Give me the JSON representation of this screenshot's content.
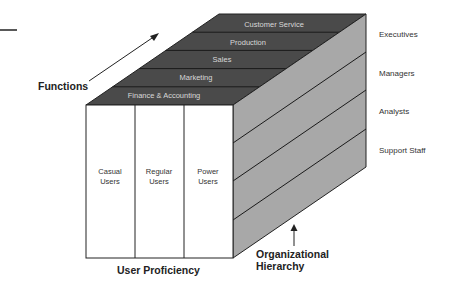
{
  "diagram": {
    "type": "3d-cube",
    "colors": {
      "top_face": "#4a4a4a",
      "side_face": "#a8a8a8",
      "front_face": "#ffffff",
      "stroke": "#222222"
    },
    "axes": {
      "functions": "Functions",
      "user_proficiency": "User Proficiency",
      "org_hierarchy_line1": "Organizational",
      "org_hierarchy_line2": "Hierarchy"
    },
    "functions": [
      "Finance & Accounting",
      "Marketing",
      "Sales",
      "Production",
      "Customer Service"
    ],
    "user_levels": [
      {
        "line1": "Casual",
        "line2": "Users"
      },
      {
        "line1": "Regular",
        "line2": "Users"
      },
      {
        "line1": "Power",
        "line2": "Users"
      }
    ],
    "hierarchy": [
      "Executives",
      "Managers",
      "Analysts",
      "Support Staff"
    ]
  }
}
